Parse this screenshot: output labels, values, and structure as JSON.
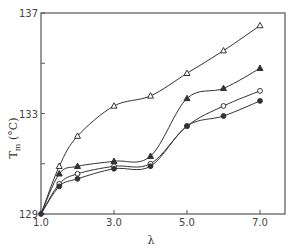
{
  "chart_data": {
    "type": "line",
    "title": "",
    "xlabel": "λ",
    "ylabel": "T_m (°C)",
    "ylabel_parts": {
      "main": "T",
      "sub": "m",
      "unit": "(°C)"
    },
    "xlim": [
      1.0,
      7.0
    ],
    "ylim": [
      129,
      137
    ],
    "x_ticks": [
      1.0,
      3.0,
      5.0,
      7.0
    ],
    "x_tick_labels": [
      "1.0",
      "3.0",
      "5.0",
      "7.0"
    ],
    "y_ticks": [
      129,
      131,
      133,
      135,
      137
    ],
    "y_tick_labels": [
      "129",
      "",
      "133",
      "",
      "137"
    ],
    "grid": false,
    "legend": null,
    "x": [
      1.0,
      1.5,
      2.0,
      3.0,
      4.0,
      5.0,
      6.0,
      7.0
    ],
    "series": [
      {
        "name": "open triangles",
        "marker": "triangle-open",
        "values": [
          129.0,
          130.9,
          132.1,
          133.3,
          133.7,
          134.6,
          135.5,
          136.5
        ]
      },
      {
        "name": "filled triangles",
        "marker": "triangle-filled",
        "values": [
          129.0,
          130.6,
          130.9,
          131.1,
          131.3,
          133.6,
          134.0,
          134.8
        ]
      },
      {
        "name": "open circles",
        "marker": "circle-open",
        "values": [
          129.0,
          130.2,
          130.6,
          130.9,
          131.0,
          132.5,
          133.3,
          133.9
        ]
      },
      {
        "name": "filled circles",
        "marker": "circle-filled",
        "values": [
          129.0,
          130.1,
          130.4,
          130.8,
          130.9,
          132.5,
          132.9,
          133.5
        ]
      }
    ]
  },
  "colors": {
    "line": "#333333",
    "frame": "#555555",
    "background": "#ffffff"
  }
}
